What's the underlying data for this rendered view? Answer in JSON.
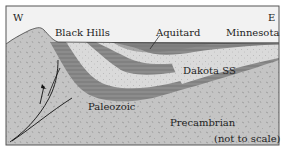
{
  "diagram": {
    "type": "geologic-cross-section",
    "labels": {
      "west": "W",
      "east": "E",
      "black_hills": "Black Hills",
      "aquitard": "Aquitard",
      "minnesota": "Minnesota",
      "dakota": "Dakota SS",
      "paleozoic": "Paleozoic",
      "precambrian": "Precambrian",
      "scale_note": "(not to scale)"
    },
    "colors": {
      "sky": "#f2f2f2",
      "precambrian": "#c4c4c4",
      "aquitard": "#8a8a8a",
      "aquitard_lines": "#5a5a5a",
      "sandstone": "#d8d8d8",
      "border": "#555555",
      "fault": "#111111"
    }
  }
}
